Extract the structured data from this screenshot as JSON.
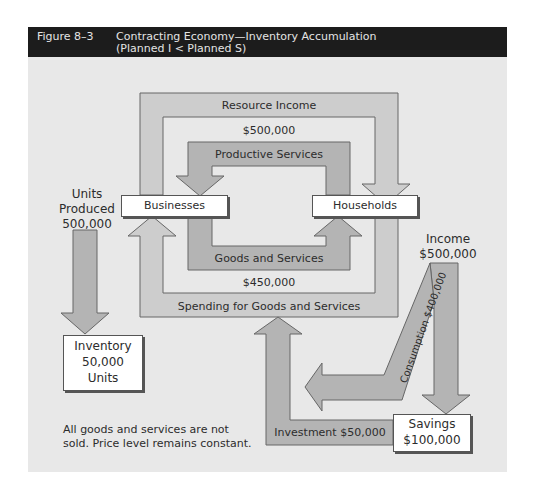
{
  "header": {
    "figure_number": "Figure 8–3",
    "title_line1": "Contracting Economy—Inventory Accumulation",
    "title_line2": "(Planned I < Planned S)"
  },
  "colors": {
    "header_bg": "#1c1c1c",
    "panel_bg": "#e8e8e8",
    "light_flow": "#cdcdcd",
    "dark_flow": "#b4b4b4",
    "stroke": "#666666"
  },
  "nodes": {
    "businesses": "Businesses",
    "households": "Households",
    "inventory": {
      "line1": "Inventory",
      "line2": "50,000",
      "line3": "Units"
    },
    "savings": {
      "line1": "Savings",
      "line2": "$100,000"
    }
  },
  "flows": {
    "resource_income": "Resource Income",
    "resource_income_value": "$500,000",
    "productive_services": "Productive Services",
    "goods_and_services": "Goods and Services",
    "spending_value": "$450,000",
    "spending": "Spending for Goods and Services",
    "units_produced": {
      "line1": "Units",
      "line2": "Produced",
      "line3": "500,000"
    },
    "income": {
      "line1": "Income",
      "line2": "$500,000"
    },
    "consumption": "Consumption $400,000",
    "investment": "Investment $50,000"
  },
  "note": {
    "line1": "All goods and services are not",
    "line2": "sold. Price level remains constant."
  }
}
